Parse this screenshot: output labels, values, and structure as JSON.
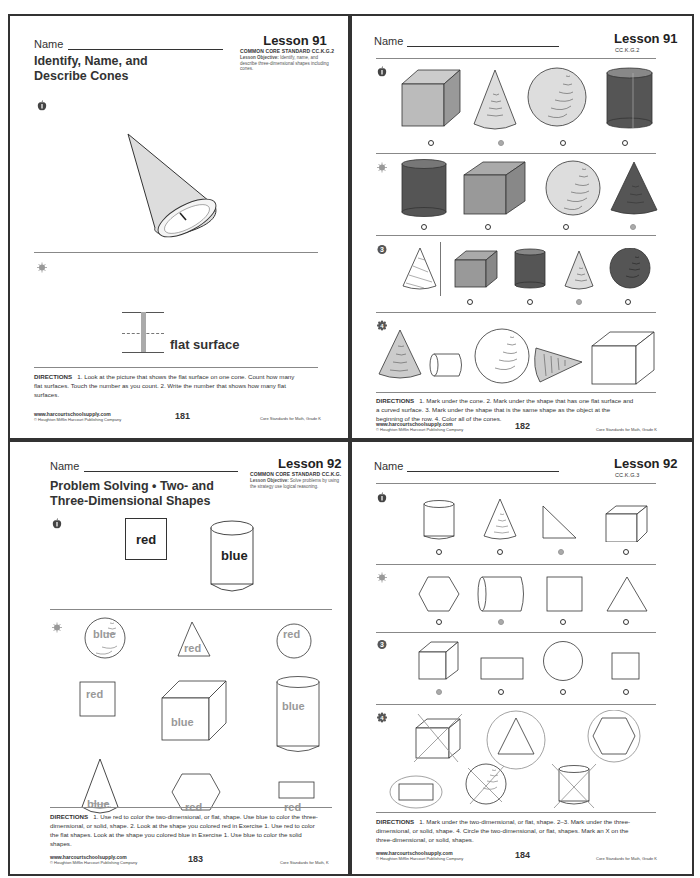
{
  "pages": [
    {
      "name_label": "Name",
      "lesson": "Lesson 91",
      "standard": "COMMON CORE STANDARD  CC.K.G.2",
      "objective_label": "Lesson Objective:",
      "objective_text": "Identify, name, and describe three-dimensional shapes including cones.",
      "title_line1": "Identify, Name, and",
      "title_line2": "Describe Cones",
      "exercise1_number": "1",
      "cone_mark": "1",
      "exercise2_number": "2",
      "flat_surface_label": "flat surface",
      "directions_label": "DIRECTIONS",
      "directions_text": "1. Look at the picture that shows the flat surface on one cone. Count how many flat surfaces. Touch the number as you count.  2. Write the number that shows how many flat surfaces.",
      "footer_url": "www.harcourtschoolsupply.com",
      "footer_copy": "© Houghton Mifflin Harcourt Publishing Company",
      "page_number": "181",
      "footer_right": "Core Standards for Math, Grade K"
    },
    {
      "name_label": "Name",
      "lesson": "Lesson 91",
      "standard": "CC.K.G.2",
      "rows": [
        {
          "number": "1",
          "shapes": [
            "cube",
            "cone",
            "sphere",
            "cylinder"
          ],
          "marked_index": 1
        },
        {
          "number": "2",
          "shapes": [
            "cylinder",
            "cube",
            "sphere",
            "cone"
          ],
          "marked_index": 3
        },
        {
          "number": "3",
          "reference": "cone",
          "shapes": [
            "cube",
            "cylinder",
            "cone",
            "sphere"
          ],
          "marked_index": 2
        },
        {
          "number": "4",
          "shapes": [
            "cone",
            "cylinder",
            "sphere",
            "cone",
            "cube"
          ]
        }
      ],
      "directions_label": "DIRECTIONS",
      "directions_text": "1. Mark under the cone.  2. Mark under the shape that has one flat surface and a curved surface.  3. Mark under the shape that is the same shape as the object at the beginning of the row.  4. Color all of the cones.",
      "footer_url": "www.harcourtschoolsupply.com",
      "footer_copy": "© Houghton Mifflin Harcourt Publishing Company",
      "page_number": "182",
      "footer_right": "Core Standards for Math, Grade K"
    },
    {
      "name_label": "Name",
      "lesson": "Lesson 92",
      "standard": "COMMON CORE STANDARD  CC.K.G.",
      "objective_label": "Lesson Objective:",
      "objective_text": "Solve problems by using the strategy use logical reasoning.",
      "title_line1": "Problem Solving • Two- and",
      "title_line2": "Three-Dimensional Shapes",
      "exercise1_number": "1",
      "ex1_labels": {
        "square": "red",
        "cylinder": "blue"
      },
      "exercise2_number": "2",
      "ex2_shapes": [
        {
          "shape": "sphere",
          "label": "blue"
        },
        {
          "shape": "triangle",
          "label": "red"
        },
        {
          "shape": "circle",
          "label": "red"
        },
        {
          "shape": "square",
          "label": "red"
        },
        {
          "shape": "cube",
          "label": "blue"
        },
        {
          "shape": "cylinder",
          "label": "blue"
        },
        {
          "shape": "cone",
          "label": "blue"
        },
        {
          "shape": "hexagon",
          "label": "red"
        },
        {
          "shape": "rectangle",
          "label": "red"
        }
      ],
      "directions_label": "DIRECTIONS",
      "directions_text": "1. Use red to color the two-dimensional, or flat, shape. Use blue to color the three-dimensional, or solid, shape. 2. Look at the shape you colored red in Exercise 1. Use red to color the flat shapes. Look at the shape you colored blue in Exercise 1. Use blue to color the solid shapes.",
      "footer_url": "www.harcourtschoolsupply.com",
      "footer_copy": "© Houghton Mifflin Harcourt Publishing Company",
      "page_number": "183",
      "footer_right": "Core Standards for Math, K"
    },
    {
      "name_label": "Name",
      "lesson": "Lesson 92",
      "standard": "CC.K.G.3",
      "rows": [
        {
          "number": "1",
          "shapes": [
            "cylinder",
            "cone",
            "right-triangle",
            "cube"
          ],
          "marked_index": 2
        },
        {
          "number": "2",
          "shapes": [
            "hexagon",
            "cylinder",
            "square",
            "triangle"
          ],
          "marked_index": 1
        },
        {
          "number": "3",
          "shapes": [
            "cube",
            "rectangle",
            "circle",
            "square"
          ],
          "marked_index": 0
        },
        {
          "number": "4",
          "shapes": [
            "cube (X)",
            "triangle (circled)",
            "hexagon (circled)",
            "rectangle (circled)",
            "sphere (X)",
            "cylinder (X)"
          ]
        }
      ],
      "directions_label": "DIRECTIONS",
      "directions_text": "1. Mark under the two-dimensional, or flat, shape.  2–3. Mark under the three-dimensional, or solid, shape.  4. Circle the two-dimensional, or flat, shapes. Mark an X on the three-dimensional, or solid, shapes.",
      "footer_url": "www.harcourtschoolsupply.com",
      "footer_copy": "© Houghton Mifflin Harcourt Publishing Company",
      "page_number": "184",
      "footer_right": "Core Standards for Math, Grade K"
    }
  ],
  "colors": {
    "dark_fill": "#555555",
    "mid_fill": "#999999",
    "light_fill": "#cccccc",
    "marked_dot": "#aaaaaa",
    "label_gray": "#999999"
  }
}
